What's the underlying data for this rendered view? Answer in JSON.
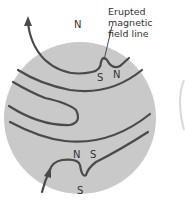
{
  "diagram": {
    "callout": {
      "line1": "Erupted magnetic",
      "line2": "field line"
    },
    "labels": {
      "top_n": "N",
      "top_loop_s": "S",
      "top_loop_n": "N",
      "bottom_loop_n": "N",
      "bottom_loop_s": "S",
      "bottom_s": "S"
    },
    "colors": {
      "disk": "#c8c8c8",
      "line": "#4a4a4a"
    }
  }
}
